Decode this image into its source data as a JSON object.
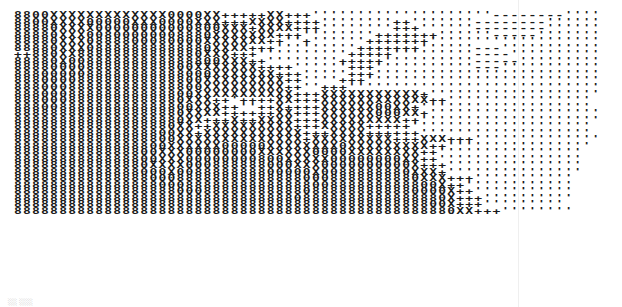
{
  "image": {
    "description": "Scanned printout of ASCII-art rendered with a typewriter-style character ramp",
    "character_ramp": [
      "8",
      "0",
      "X",
      "+",
      "'",
      "-"
    ],
    "rows": [
      "8800XXXXXXXXXXXXX0000XX+++++XX+++''''''''''''''''''''--------''''",
      "8800XXXX00000XXX0000XXX+++XXXX++++''''''''++'''''''--------''''''",
      "88880XXXX00000000000800XXX+XXXX+++''''''''+++''''''--------''''''",
      "88880XXX00800000008880XXXXXXX+++''''''''+++++++''''''-----'''''''",
      "88880XXX0888800080000XXXXXXX++''+''''''+++++++'''''''''''''''''''",
      "88880XXX08888888888880XXXX+++'''''''''+++++++''''''---'''''''''''",
      "++880XX88888888888880XXX+++''''''''''+++++'''''''''----''''''''''",
      "88880X00888888888888800XXX++''''''''+++++''''''''''-----'''''''''",
      "88880000888888888800XXXXXXX++++''''''+++'''''''''''---'''''''''''",
      "8880000088888888888000XXXXXXX+++'''''+++'''''''''''''''''''''''''",
      "888000088888888888800XXXXXXXXX++''''+++''''''''''''''''''''''''''",
      "888000888888888888800XXXXXXXXX++''+++''''''''''''''''''''''''''''",
      "88800088888888888800XXXXXXXXXXX+++XXXXXXXXXXX+'''''''''''''''''''",
      "8880008888888888880XXX++'++++XX+++XXXXXXXXXXXX++''''''''''''''''",
      "88800888888888888800XXX++''++X++++XXXXXX00XX+'''''''''''''''''''",
      "8888888888888888880XXXX++++++XX+++XXXXXX000XX+'''''''''''''''''''",
      "8888888888888888880XX+++X++XXXX+++XXXXXXXXX++''''''''''''''''''''",
      "888888888888888880XX++XXXXXXXXX+++XXXXX+++++''''''''''''''''''''",
      "888888888888888800XX+XXXXXXXXXXX+++XXXX++++++'''''''''''''''''''",
      "888888888888888800XXXXXXXXXXXXXX+XXXXXXXXX+++XXX+++''''''''''''''",
      "88888888888888800XXXXXX00000XXXXXXXX0XXXXXXXXX++''''''''''''''''",
      "8888888888888800XXX00000000XXXXXX0000XXXXXXXX++''''''''''''''''",
      "8888888888888800XXX00000000800XXXXX00000000XX++''''''''''''''''",
      "888888888888880XXXX000888888000XXX0000000000X+++'''''''''''''''",
      "88888888888888000X008888888800000X0088888880XXX+'''''''''''''''",
      "888888888888888000888888888888880008888888880XXX+++'''''''''''",
      "88888888888888880008888888888888800888888888800X++''''''''''''",
      "888888888888888888000888888888880888888888880000X++'''''''''''",
      "888888888888888888888888888888808888888888888880X+++''''''''''",
      "888888888888888888888888888888888888888888888800X+++'''''''''",
      "8888888888888888888888888888888888888888888888880XX+++''''''''"
    ]
  },
  "caption": "░░ ░░░"
}
